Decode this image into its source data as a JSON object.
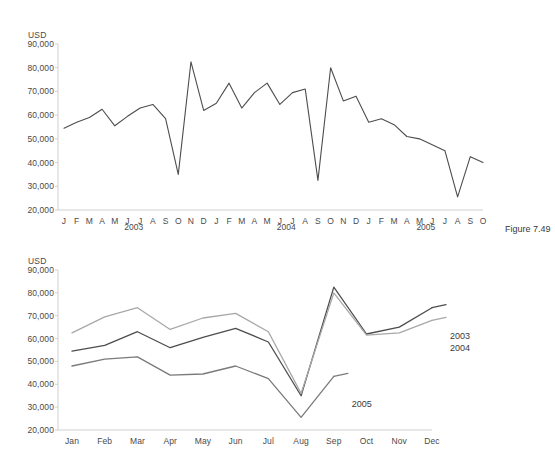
{
  "figure": {
    "caption": "Figure 7.49"
  },
  "chart_data": [
    {
      "id": "monthly-timeseries",
      "type": "line",
      "title": "",
      "xlabel": "",
      "ylabel": "USD",
      "ylim": [
        20000,
        90000
      ],
      "ytick_labels": [
        "90,000",
        "80,000",
        "70,000",
        "60,000",
        "50,000",
        "40,000",
        "30,000",
        "20,000"
      ],
      "yticks": [
        90000,
        80000,
        70000,
        60000,
        50000,
        40000,
        30000,
        20000
      ],
      "grid": false,
      "legend": "none",
      "x_tick_labels": [
        "J",
        "F",
        "M",
        "A",
        "M",
        "J",
        "J",
        "A",
        "S",
        "O",
        "N",
        "D",
        "J",
        "F",
        "M",
        "A",
        "M",
        "J",
        "J",
        "A",
        "S",
        "O",
        "N",
        "D",
        "J",
        "F",
        "M",
        "A",
        "M",
        "J",
        "J",
        "A",
        "S",
        "O"
      ],
      "year_groups": [
        {
          "label": "2003",
          "start_index": 0,
          "end_index": 11
        },
        {
          "label": "2004",
          "start_index": 12,
          "end_index": 23
        },
        {
          "label": "2005",
          "start_index": 24,
          "end_index": 33
        }
      ],
      "series": [
        {
          "name": "Monthly value",
          "color": "#4d4d4d",
          "values": [
            54500,
            57000,
            59000,
            62500,
            55500,
            59500,
            63000,
            64500,
            58500,
            35000,
            82500,
            62000,
            65000,
            73500,
            63000,
            69500,
            73500,
            64500,
            69500,
            71000,
            32500,
            80000,
            66000,
            68000,
            57000,
            58500,
            56000,
            51000,
            50000,
            47500,
            45000,
            25500,
            42500,
            40000
          ]
        }
      ]
    },
    {
      "id": "year-over-year-overlay",
      "type": "line",
      "title": "",
      "xlabel": "",
      "ylabel": "USD",
      "ylim": [
        20000,
        90000
      ],
      "ytick_labels": [
        "90,000",
        "80,000",
        "70,000",
        "60,000",
        "50,000",
        "40,000",
        "30,000",
        "20,000"
      ],
      "yticks": [
        90000,
        80000,
        70000,
        60000,
        50000,
        40000,
        30000,
        20000
      ],
      "grid": false,
      "legend": "right-inline",
      "categories": [
        "Jan",
        "Feb",
        "Mar",
        "Apr",
        "May",
        "Jun",
        "Jul",
        "Aug",
        "Sep",
        "Oct",
        "Nov",
        "Dec"
      ],
      "series": [
        {
          "name": "2003",
          "color": "#4d4d4d",
          "values": [
            54500,
            57000,
            63000,
            56000,
            60500,
            64500,
            58500,
            35000,
            82500,
            62000,
            65000,
            73500
          ]
        },
        {
          "name": "2004",
          "color": "#a8a8a8",
          "values": [
            62500,
            69500,
            73500,
            64000,
            69000,
            71000,
            63000,
            36000,
            80000,
            61500,
            62500,
            68000
          ]
        },
        {
          "name": "2005",
          "color": "#7a7a7a",
          "values": [
            48000,
            51000,
            52000,
            44000,
            44500,
            48000,
            42500,
            25500,
            43500,
            null,
            null,
            null
          ]
        }
      ]
    }
  ]
}
